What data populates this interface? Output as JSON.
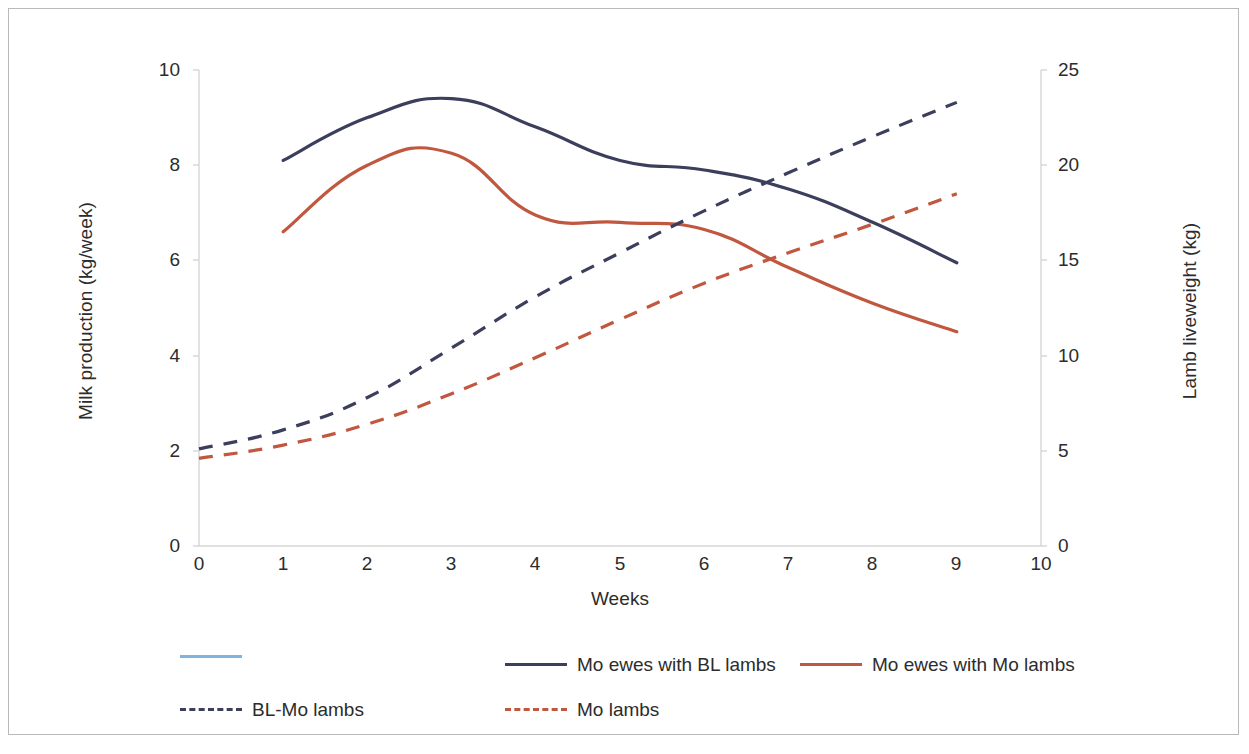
{
  "figure": {
    "background_color": "#ffffff",
    "border_color": "#b9b9b9"
  },
  "chart_data": {
    "type": "line",
    "title": "",
    "subtitle": "",
    "xlabel": "Weeks",
    "ylabel": "Milk production (kg/week)",
    "y2label": "Lamb liveweight (kg)",
    "xlim": [
      0,
      10
    ],
    "ylim": [
      0,
      10
    ],
    "y2lim": [
      0,
      25
    ],
    "xticks": [
      "0",
      "1",
      "2",
      "3",
      "4",
      "5",
      "6",
      "7",
      "8",
      "9",
      "10"
    ],
    "yticks": [
      "0",
      "2",
      "4",
      "6",
      "8",
      "10"
    ],
    "y2ticks": [
      "0",
      "5",
      "10",
      "15",
      "20",
      "25"
    ],
    "grid": false,
    "legend_position": "bottom",
    "series": [
      {
        "name": "Mo ewes with BL lambs",
        "axis": "left",
        "style": "solid",
        "color": "#3b3f5c",
        "x": [
          1,
          2,
          3,
          4,
          5,
          6,
          7,
          8,
          9
        ],
        "values": [
          8.1,
          9.0,
          9.4,
          8.8,
          8.1,
          7.9,
          7.5,
          6.8,
          5.95
        ]
      },
      {
        "name": "Mo ewes with Mo lambs",
        "axis": "left",
        "style": "solid",
        "color": "#c0573e",
        "x": [
          1,
          2,
          3,
          4,
          5,
          6,
          7,
          8,
          9
        ],
        "values": [
          6.6,
          8.0,
          8.25,
          6.95,
          6.8,
          6.65,
          5.85,
          5.1,
          4.5
        ]
      },
      {
        "name": "BL-Mo lambs",
        "axis": "right",
        "style": "dashed",
        "color": "#3b3f5c",
        "x": [
          0,
          1,
          2,
          3,
          4,
          5,
          6,
          7,
          8,
          9
        ],
        "values": [
          5.1,
          6.1,
          7.8,
          10.4,
          13.1,
          15.4,
          17.6,
          19.6,
          21.5,
          23.3
        ]
      },
      {
        "name": "Mo lambs",
        "axis": "right",
        "style": "dashed",
        "color": "#c0573e",
        "x": [
          0,
          1,
          2,
          3,
          4,
          5,
          6,
          7,
          8,
          9
        ],
        "values": [
          4.6,
          5.3,
          6.4,
          8.0,
          9.9,
          11.9,
          13.8,
          15.4,
          16.9,
          18.5
        ]
      }
    ],
    "legend_entries": [
      {
        "label": "",
        "color": "#7fb3e0",
        "style": "solid"
      },
      {
        "label": "Mo ewes with BL lambs",
        "color": "#3b3f5c",
        "style": "solid"
      },
      {
        "label": "Mo ewes with Mo lambs",
        "color": "#c0573e",
        "style": "solid"
      },
      {
        "label": "BL-Mo lambs",
        "color": "#3b3f5c",
        "style": "dashed"
      },
      {
        "label": "Mo lambs",
        "color": "#c0573e",
        "style": "dashed"
      }
    ]
  }
}
